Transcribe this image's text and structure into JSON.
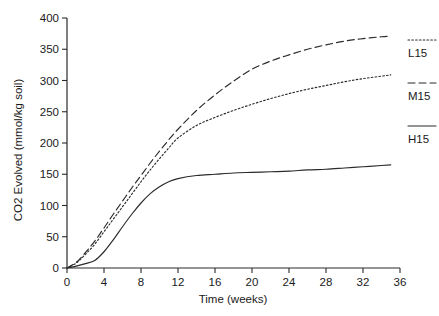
{
  "chart_data": {
    "type": "line",
    "title": "",
    "xlabel": "Time (weeks)",
    "ylabel": "CO2 Evolved (mmol/kg soil)",
    "xlim": [
      0,
      36
    ],
    "ylim": [
      0,
      400
    ],
    "xticks": [
      0,
      4,
      8,
      12,
      16,
      20,
      24,
      28,
      32,
      36
    ],
    "yticks": [
      0,
      50,
      100,
      150,
      200,
      250,
      300,
      350,
      400
    ],
    "xtick_labels": [
      "0",
      "4",
      "8",
      "12",
      "16",
      "20",
      "24",
      "28",
      "32",
      "36"
    ],
    "ytick_labels": [
      "0",
      "50",
      "100",
      "150",
      "200",
      "250",
      "300",
      "350",
      "400"
    ],
    "grid": false,
    "legend_position": "right",
    "x": [
      0,
      1,
      2,
      3,
      4,
      5,
      6,
      7,
      8,
      9,
      10,
      11,
      12,
      14,
      16,
      18,
      20,
      22,
      24,
      26,
      28,
      30,
      32,
      34,
      35
    ],
    "series": [
      {
        "name": "L15",
        "linestyle": "dotted",
        "color": "#2b2b2b",
        "values": [
          0,
          8,
          22,
          38,
          58,
          78,
          98,
          118,
          138,
          157,
          175,
          192,
          208,
          228,
          241,
          252,
          262,
          271,
          279,
          286,
          292,
          298,
          303,
          307,
          309
        ]
      },
      {
        "name": "M15",
        "linestyle": "dashed",
        "color": "#2b2b2b",
        "values": [
          0,
          9,
          25,
          43,
          64,
          86,
          107,
          128,
          148,
          168,
          187,
          205,
          222,
          252,
          277,
          299,
          318,
          331,
          341,
          350,
          357,
          363,
          367,
          370,
          371
        ]
      },
      {
        "name": "H15",
        "linestyle": "solid",
        "color": "#2b2b2b",
        "values": [
          0,
          3,
          7,
          12,
          26,
          45,
          66,
          86,
          104,
          119,
          130,
          138,
          143,
          148,
          150,
          152,
          153,
          154,
          155,
          157,
          158,
          160,
          162,
          164,
          165
        ]
      }
    ],
    "legend": [
      {
        "label": "L15",
        "linestyle": "dotted"
      },
      {
        "label": "M15",
        "linestyle": "dashed"
      },
      {
        "label": "H15",
        "linestyle": "solid"
      }
    ]
  }
}
